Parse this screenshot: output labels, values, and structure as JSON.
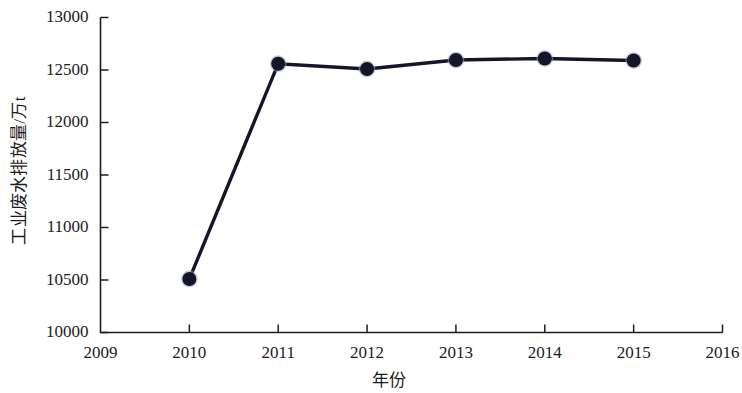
{
  "chart_data": {
    "type": "line",
    "title": "",
    "xlabel": "年份",
    "ylabel": "工业废水排放量/万t",
    "x": [
      2010,
      2011,
      2012,
      2013,
      2014,
      2015
    ],
    "categories": [
      "2010",
      "2011",
      "2012",
      "2013",
      "2014",
      "2015"
    ],
    "series": [
      {
        "name": "工业废水排放量",
        "values": [
          10510,
          12560,
          12510,
          12595,
          12610,
          12590
        ]
      }
    ],
    "xlim": [
      2009,
      2016
    ],
    "ylim": [
      10000,
      13000
    ],
    "xticks": [
      2009,
      2010,
      2011,
      2012,
      2013,
      2014,
      2015,
      2016
    ],
    "xtick_labels": [
      "2009",
      "2010",
      "2011",
      "2012",
      "2013",
      "2014",
      "2015",
      "2016"
    ],
    "yticks": [
      10000,
      10500,
      11000,
      11500,
      12000,
      12500,
      13000
    ],
    "ytick_labels": [
      "10000",
      "10500",
      "11000",
      "11500",
      "12000",
      "12500",
      "13000"
    ],
    "grid": false,
    "legend": null,
    "legend_position": "none",
    "colors": {
      "line": "#14142a",
      "marker": "#14142a",
      "marker_halo": "#9aa8bd",
      "axis": "#1d1d1d",
      "text": "#1b1b1b",
      "background": "#ffffff"
    },
    "marker": "circle",
    "marker_size": 7
  }
}
